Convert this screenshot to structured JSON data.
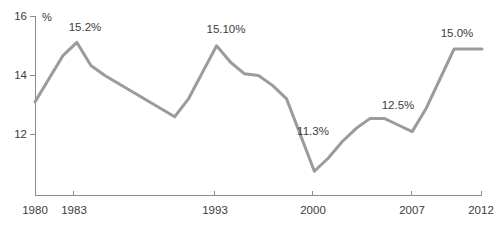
{
  "chart_data": {
    "type": "line",
    "title": "",
    "subtitle": "",
    "xlabel": "",
    "ylabel": "",
    "unit_label": "%",
    "grid": false,
    "legend": "none",
    "xlim": [
      1980,
      2012
    ],
    "ylim": [
      10.55,
      16.0
    ],
    "yticks": [
      12,
      14,
      16
    ],
    "ytick_labels": [
      "12",
      "14",
      "16"
    ],
    "xticks": [
      1980,
      1983,
      1993,
      2000,
      2007,
      2012
    ],
    "xtick_labels": [
      "1980",
      "1983",
      "1993",
      "2000",
      "2007",
      "2012"
    ],
    "series": [
      {
        "name": "value",
        "color": "#9b9b9b",
        "x": [
          1980,
          1981,
          1982,
          1983,
          1984,
          1985,
          1986,
          1987,
          1988,
          1989,
          1990,
          1991,
          1992,
          1993,
          1994,
          1995,
          1996,
          1997,
          1998,
          1999,
          2000,
          2001,
          2002,
          2003,
          2004,
          2005,
          2006,
          2007,
          2008,
          2009,
          2010,
          2011,
          2012
        ],
        "values": [
          13.4,
          14.1,
          14.8,
          15.2,
          14.5,
          14.2,
          13.95,
          13.7,
          13.45,
          13.2,
          12.95,
          13.5,
          14.3,
          15.1,
          14.6,
          14.25,
          14.2,
          13.9,
          13.5,
          12.4,
          11.3,
          11.7,
          12.2,
          12.6,
          12.9,
          12.9,
          12.7,
          12.5,
          13.2,
          14.1,
          15.0,
          15.0,
          15.0
        ],
        "annotations": [
          {
            "label": "15.2%",
            "x": 1983,
            "value": 15.2
          },
          {
            "label": "15.10%",
            "x": 1993,
            "value": 15.1
          },
          {
            "label": "11.3%",
            "x": 2000,
            "value": 11.3
          },
          {
            "label": "12.5%",
            "x": 2007,
            "value": 12.5
          },
          {
            "label": "15.0%",
            "x": 2010,
            "value": 15.0
          }
        ]
      }
    ]
  },
  "axes": {
    "y_tick_labels": [
      "16",
      "14",
      "12"
    ],
    "x_tick_labels": [
      "1980",
      "1983",
      "1993",
      "2000",
      "2007",
      "2012"
    ],
    "unit": "%"
  },
  "labels": {
    "peak_1983": "15.2%",
    "peak_1993": "15.10%",
    "trough_2000": "11.3%",
    "dip_2007": "12.5%",
    "peak_2010": "15.0%"
  },
  "colors": {
    "line": "#9b9b9b",
    "axis": "#8c8c8c",
    "text": "#3c3c3c",
    "background": "#ffffff"
  }
}
